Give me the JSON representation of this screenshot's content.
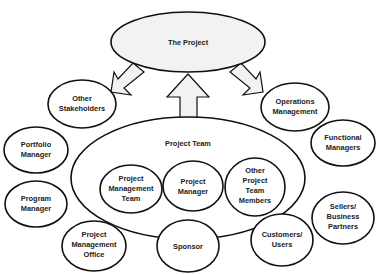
{
  "diagram": {
    "center": {
      "label": "The Project"
    },
    "arrows": [
      {
        "from": "The Project",
        "to": "Other Stakeholders",
        "direction": "down-left"
      },
      {
        "from": "Project Team",
        "to": "The Project",
        "direction": "up"
      },
      {
        "from": "The Project",
        "to": "Operations Management",
        "direction": "down-right"
      }
    ],
    "project_team": {
      "label": "Project Team",
      "members": [
        {
          "lines": [
            "Project",
            "Management",
            "Team"
          ]
        },
        {
          "lines": [
            "Project",
            "Manager"
          ]
        },
        {
          "lines": [
            "Other",
            "Project",
            "Team",
            "Members"
          ]
        }
      ]
    },
    "stakeholders": {
      "other_stakeholders": {
        "lines": [
          "Other",
          "Stakeholders"
        ]
      },
      "operations_management": {
        "lines": [
          "Operations",
          "Management"
        ]
      },
      "portfolio_manager": {
        "lines": [
          "Portfolio",
          "Manager"
        ]
      },
      "program_manager": {
        "lines": [
          "Program",
          "Manager"
        ]
      },
      "pmo": {
        "lines": [
          "Project",
          "Management",
          "Office"
        ]
      },
      "sponsor": {
        "lines": [
          "Sponsor"
        ]
      },
      "customers_users": {
        "lines": [
          "Customers/",
          "Users"
        ]
      },
      "functional_managers": {
        "lines": [
          "Functional",
          "Managers"
        ]
      },
      "sellers_partners": {
        "lines": [
          "Sellers/",
          "Business",
          "Partners"
        ]
      }
    },
    "colors": {
      "stroke": "#111111",
      "project_fill": "#f2f2f2",
      "node_fill": "#ffffff",
      "text": "#222222"
    }
  }
}
